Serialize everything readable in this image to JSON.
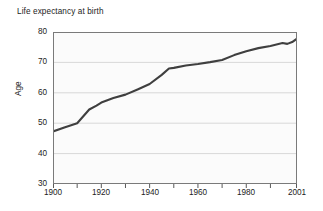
{
  "chart_data": {
    "type": "line",
    "title": "Life expectancy at birth",
    "xlabel": "",
    "ylabel": "Age",
    "xlim": [
      1900,
      2001
    ],
    "ylim": [
      30,
      80
    ],
    "grid": true,
    "legend": "none",
    "yticks": [
      80,
      70,
      60,
      50,
      40,
      30
    ],
    "ytick_labels": [
      "80",
      "70",
      "60",
      "50",
      "40",
      "30"
    ],
    "xticks": [
      1900,
      1920,
      1940,
      1960,
      1980,
      2001
    ],
    "xtick_labels": [
      "1900",
      "1920",
      "1940",
      "1960",
      "1980",
      "2001"
    ],
    "xminor_ticks": [
      1910,
      1930,
      1950,
      1970,
      1990
    ],
    "series": [
      {
        "name": "Life expectancy at birth",
        "color": "#3f3f3f",
        "x": [
          1900,
          1905,
          1910,
          1915,
          1918,
          1920,
          1925,
          1930,
          1935,
          1940,
          1945,
          1948,
          1950,
          1955,
          1960,
          1965,
          1970,
          1975,
          1980,
          1985,
          1990,
          1995,
          1997,
          1999,
          2001
        ],
        "values": [
          47.3,
          48.7,
          50.0,
          54.5,
          55.8,
          56.8,
          58.3,
          59.4,
          61.1,
          62.9,
          65.9,
          68.0,
          68.2,
          69.0,
          69.5,
          70.1,
          70.8,
          72.4,
          73.7,
          74.7,
          75.4,
          76.4,
          76.1,
          76.7,
          77.8
        ]
      }
    ]
  },
  "annotations": {
    "note": ""
  }
}
